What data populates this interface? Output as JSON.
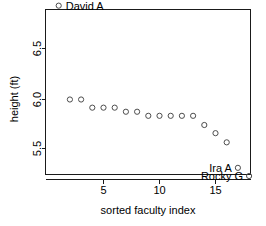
{
  "chart_data": {
    "type": "scatter",
    "title": "",
    "xlabel": "sorted faculty index",
    "ylabel": "height (ft)",
    "xlim": [
      0.3,
      18.7
    ],
    "ylim": [
      5.18,
      6.98
    ],
    "grid": false,
    "legend": "none",
    "xticks": [
      5,
      10,
      15
    ],
    "xtick_labels": [
      "5",
      "10",
      "15"
    ],
    "yticks": [
      5.5,
      6.0,
      6.5
    ],
    "ytick_labels": [
      "5.5",
      "6.0",
      "6.5"
    ],
    "marker": "open-circle",
    "marker_color": "#4d4d4d",
    "x": [
      1,
      2,
      3,
      4,
      5,
      6,
      7,
      8,
      9,
      10,
      11,
      12,
      13,
      14,
      15,
      16,
      17,
      18
    ],
    "y": [
      6.92,
      6.0,
      6.0,
      5.92,
      5.92,
      5.92,
      5.88,
      5.88,
      5.84,
      5.84,
      5.84,
      5.84,
      5.84,
      5.75,
      5.67,
      5.58,
      5.33,
      5.25
    ],
    "annotations": [
      {
        "label": "David A",
        "x": 1,
        "y": 6.92,
        "position": "right"
      },
      {
        "label": "Ira A",
        "x": 17,
        "y": 5.33,
        "position": "left"
      },
      {
        "label": "Rocky G",
        "x": 18,
        "y": 5.25,
        "position": "left"
      }
    ]
  },
  "axes": {
    "x_title": "sorted faculty index",
    "y_title": "height (ft)",
    "x_tick_labels": [
      "5",
      "10",
      "15"
    ],
    "y_tick_labels": [
      "5.5",
      "6.0",
      "6.5"
    ]
  },
  "labels": {
    "david": "David A",
    "ira": "Ira A",
    "rocky": "Rocky G"
  },
  "colors": {
    "marker": "#4d4d4d",
    "axis": "#1a1a1a",
    "background": "#ffffff",
    "text": "#000000"
  }
}
